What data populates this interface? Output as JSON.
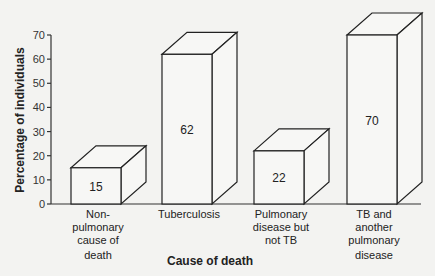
{
  "chart_data": {
    "type": "bar",
    "style": "3d-bar",
    "title": "",
    "xlabel": "Cause of death",
    "ylabel": "Percentage of individuals",
    "ylim": [
      0,
      70
    ],
    "yticks": [
      0,
      10,
      20,
      30,
      40,
      50,
      60,
      70
    ],
    "grid": false,
    "legend": null,
    "categories": [
      "Non-pulmonary cause of death",
      "Tuberculosis",
      "Pulmonary disease but not TB",
      "TB and another pulmonary disease"
    ],
    "category_lines": [
      [
        "Non-",
        "pulmonary",
        "cause of",
        "death"
      ],
      [
        "Tuberculosis"
      ],
      [
        "Pulmonary",
        "disease but",
        "not TB"
      ],
      [
        "TB and",
        "another",
        "pulmonary",
        "disease"
      ]
    ],
    "values": [
      15,
      62,
      22,
      70
    ],
    "data_labels": [
      "15",
      "62",
      "22",
      "70"
    ]
  }
}
